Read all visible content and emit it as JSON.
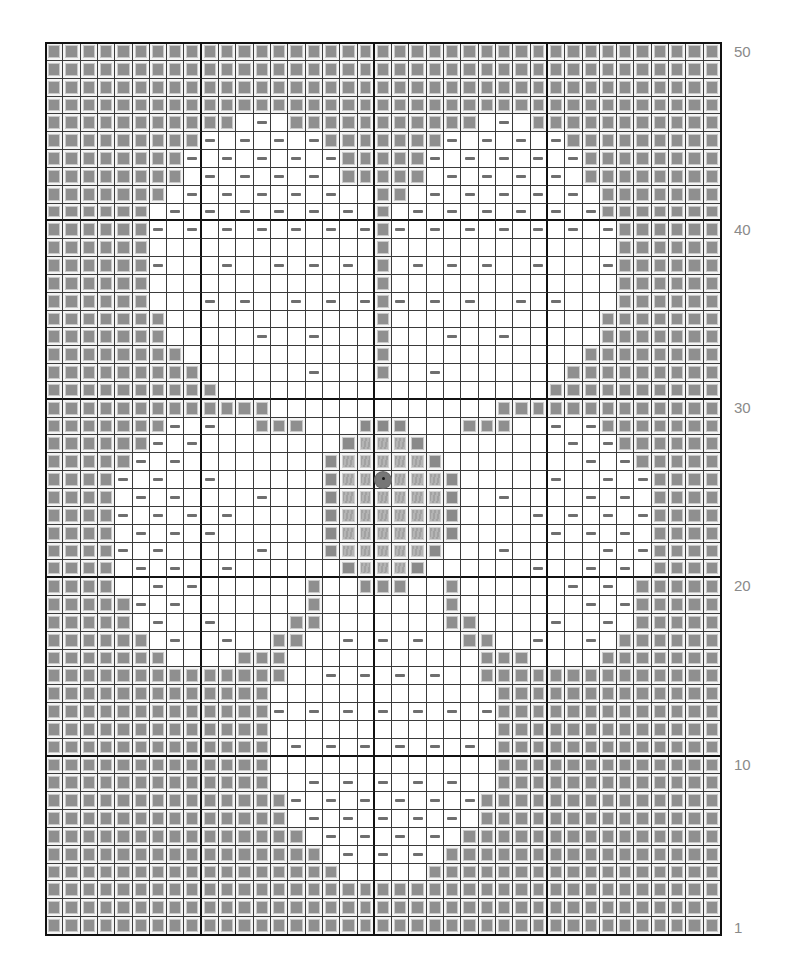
{
  "chart_data": {
    "type": "table",
    "title": "",
    "columns": 39,
    "rows": 50,
    "legend": {
      "G": "gray stitch (background)",
      "W": "white stitch",
      "D": "white stitch with purl dash",
      "O": "center motif outline gray",
      "L": "center motif light hatched gray",
      "C": "center stitch marker circle"
    },
    "row_labels": [
      "50",
      "40",
      "30",
      "20",
      "10",
      "1"
    ],
    "grid_top_to_bottom": [
      "GGGGGGGGGGGGGGGGGGGGGGGGGGGGGGGGGGGGGGG",
      "GGGGGGGGGGGGGGGGGGGGGGGGGGGGGGGGGGGGGGG",
      "GGGGGGGGGGGGGGGGGGGGGGGGGGGGGGGGGGGGGGG",
      "GGGGGGGGGGGGGGGGGGGGGGGGGGGGGGGGGGGGGGG",
      "GGGGGGGGGGGWDWGGGGGGGGGGGWDWGGGGGGGGGGG",
      "GGGGGGGGGDWDWDWDGGGGGGGDWDWDWDGGGGGGGGG",
      "GGGGGGGGDWDWDWDWDGGGGGDWDWDWDWDGGGGGGGG",
      "GGGGGGGGWDWDWDWDWGGGGGWDWDWDWDWGGGGGGGG",
      "GGGGGGGWDWDWDWDWDWWGGWDWDWDWDWDWGGGGGGG",
      "GGGGGGWDWDWDWDWDWDWGWDWDWDWDWDWDGGGGGGG",
      "GGGGGGDWDWDWDWDWDWDGDWDWDWDWDWDWDGGGGGG",
      "GGGGGGWWWWWWWWWWWWWGWWWWWWWWWWWWWGGGGGG",
      "GGGGGGDWWWDWWDWDWDWGWDWDWDWWDWWWDGGGGGG",
      "GGGGGGWWWWWWWWWWWWWGWWWWWWWWWWWWWGGGGGG",
      "GGGGGGWWWDWDWWDWDWDGDWDWDWWDWDWWWGGGGGG",
      "GGGGGGGWWWWWWWWWWWWGWWWWWWWWWWWWGGGGGGG",
      "GGGGGGGWWWWWDWWDWWWGWWWDWWDWWWWWGGGGGGG",
      "GGGGGGGGWWWWWWWWWWWGWWWWWWWWWWWGGGGGGGG",
      "GGGGGGGGGWWWWWWDWWWGWWDWWWWWWWGGGGGGGGG",
      "GGGGGGGGGGWWWWWWWWWWWWWWWWWWWGGGGGGGGGG",
      "GGGGGGGGGGGGGWWWWWWWWWWWWWGGGGGGGGGGGGG",
      "GGGGGGGDWDWWGGGWWWOOOWWWGGGWWDWDGGGGGGG",
      "GGGGGGDWDWWWWWWWWOLLLOWWWWWWWWDWDGGGGGG",
      "GGGGGDWDWWWWWWWWOLLLLLOWWWWWWWWDWDGGGGG",
      "GGGGDWDWWDWWWWWWOLLCLLLOWWWWWDWWDWDGGGG",
      "GGGGWDWDWWWWDWWWOLLLLLLOWWDWWWWDWDWGGGG",
      "GGGGDWDWDWDWWWWWOLLLLLLOWWWWDWDWDWDGGGG",
      "GGGGWDWDWDWWWWWWOLLLLLLOWWWWWDWDWDWGGGG",
      "GGGGDWDWWWWWDWWWOLLLLLOWWWDWWWWWDWDGGGG",
      "GGGGWDWDWWDWWWWWWOLLLOWWWWWWDWWDWDWGGGG",
      "GGGGWWDWDWWWWWWGWWGGGWWGWWWWWWDWDWGGGGG",
      "GGGGGDWDWWWWWWWGWWWWWWWGWWWWWWWDWDGGGGG",
      "GGGGGWDWWDWWWWGGWWWWWWWGGWWWWDWWDWGGGGG",
      "GGGGGGWDWWDWWGGWWDWDWDWWGGWWDWWDWGGGGGG",
      "GGGGGGGWWWWGGGWWWWWWWWWWWGGGWWWWGGGGGGG",
      "GGGGGGGGGGGGGGWWDWDWDWDWWGGGGGGGGGGGGGG",
      "GGGGGGGGGGGGGWWWWWWWWWWWWWGGGGGGGGGGGGG",
      "GGGGGGGGGGGGGDWDWDWDWDWDWDGGGGGGGGGGGGG",
      "GGGGGGGGGGGGGWWWWWWWWWWWWWGGGGGGGGGGGGG",
      "GGGGGGGGGGGGGWDWDWDWDWDWDWGGGGGGGGGGGGG",
      "GGGGGGGGGGGGGWWWWWWWWWWWWWGGGGGGGGGGGGG",
      "GGGGGGGGGGGGGWWDWDWDWDWDWWGGGGGGGGGGGGG",
      "GGGGGGGGGGGGGGDWDWDWDWDWDGGGGGGGGGGGGGG",
      "GGGGGGGGGGGGGGWDWDWDWDWDWGGGGGGGGGGGGGG",
      "GGGGGGGGGGGGGGGWDWDWDWDWGGGGGGGGGGGGGGG",
      "GGGGGGGGGGGGGGGGWDWDWDWGGGGGGGGGGGGGGGG",
      "GGGGGGGGGGGGGGGGGWWWWWGGGGGGGGGGGGGGGGG",
      "GGGGGGGGGGGGGGGGGGGGGGGGGGGGGGGGGGGGGGG",
      "GGGGGGGGGGGGGGGGGGGGGGGGGGGGGGGGGGGGGGG",
      "GGGGGGGGGGGGGGGGGGGGGGGGGGGGGGGGGGGGGGG"
    ],
    "grid_lines": {
      "major_every_rows": 10,
      "major_column_boundaries": [
        9,
        19,
        29
      ]
    },
    "colors": {
      "gray_stitch": "#8f8f8f",
      "outline_stitch": "#8a8a8a",
      "light_stitch": "#aaaaaa",
      "dash": "#6e6e6e",
      "grid_line": "#3a3a3a",
      "major_line": "#111111",
      "label": "#8a8a8a"
    }
  },
  "labels": {
    "r50": "50",
    "r40": "40",
    "r30": "30",
    "r20": "20",
    "r10": "10",
    "r1": "1"
  }
}
